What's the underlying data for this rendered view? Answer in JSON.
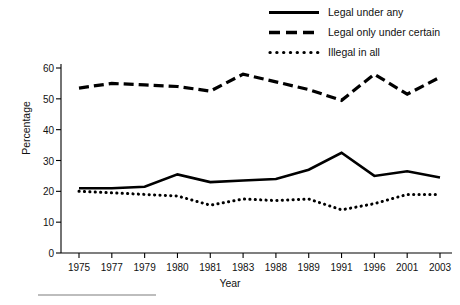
{
  "chart_data": {
    "type": "line",
    "title": "",
    "xlabel": "Year",
    "ylabel": "Percentage",
    "categories": [
      "1975",
      "1977",
      "1979",
      "1980",
      "1981",
      "1983",
      "1988",
      "1989",
      "1991",
      "1996",
      "2001",
      "2003"
    ],
    "ylim": [
      0,
      60
    ],
    "yticks": [
      0,
      10,
      20,
      30,
      40,
      50,
      60
    ],
    "grid": false,
    "legend_position": "top-right",
    "series": [
      {
        "name": "Legal under any",
        "style": "solid",
        "color": "#000000",
        "values": [
          21,
          21,
          21.5,
          25.5,
          23,
          23.5,
          24,
          27,
          32.5,
          25,
          26.5,
          24.5
        ]
      },
      {
        "name": "Legal only under certain",
        "style": "dashed",
        "color": "#000000",
        "values": [
          53.5,
          55,
          54.5,
          54,
          52.5,
          58,
          55.5,
          53,
          49.5,
          58,
          51.5,
          57
        ]
      },
      {
        "name": "Illegal in all",
        "style": "dotted",
        "color": "#000000",
        "values": [
          20,
          19.5,
          19,
          18.5,
          15.5,
          17.5,
          17,
          17.5,
          14,
          16,
          19,
          19
        ]
      }
    ]
  },
  "legend": {
    "items": [
      {
        "label": "Legal under any",
        "style": "solid"
      },
      {
        "label": "Legal only under certain",
        "style": "dashed"
      },
      {
        "label": "Illegal in all",
        "style": "dotted"
      }
    ]
  },
  "axes": {
    "y_title": "Percentage",
    "x_title": "Year"
  }
}
